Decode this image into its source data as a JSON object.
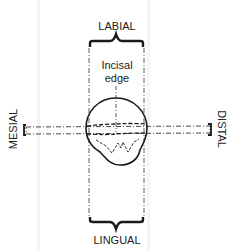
{
  "diagram": {
    "labels": {
      "top": "LABIAL",
      "bottom": "LINGUAL",
      "left": "MESIAL",
      "right": "DISTAL",
      "center_line1": "Incisal",
      "center_line2": "edge"
    },
    "colors": {
      "ink": "#1a1a1a",
      "background": "#ffffff"
    }
  }
}
